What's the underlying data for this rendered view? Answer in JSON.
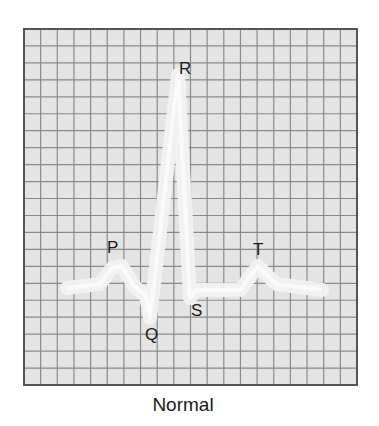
{
  "figure": {
    "caption": "Normal",
    "grid": {
      "left": 24,
      "top": 29,
      "right": 357,
      "bottom": 385,
      "columns": 20,
      "rows": 21,
      "background": "#e4e4e4",
      "line_color": "#8a8a8a",
      "border_color": "#555555"
    },
    "trace_color": "#f2f2f2",
    "labels": [
      {
        "text": "R",
        "x": 179,
        "y": 60
      },
      {
        "text": "P",
        "x": 107,
        "y": 239
      },
      {
        "text": "T",
        "x": 253,
        "y": 241
      },
      {
        "text": "S",
        "x": 191,
        "y": 302
      },
      {
        "text": "Q",
        "x": 145,
        "y": 326
      }
    ]
  },
  "chart_data": {
    "type": "line",
    "title": "Normal",
    "grid": true,
    "waves": [
      "P",
      "Q",
      "R",
      "S",
      "T"
    ],
    "points": [
      {
        "x": 67,
        "y": 288
      },
      {
        "x": 100,
        "y": 284
      },
      {
        "x": 112,
        "y": 268
      },
      {
        "x": 122,
        "y": 266
      },
      {
        "x": 134,
        "y": 286
      },
      {
        "x": 146,
        "y": 296
      },
      {
        "x": 150,
        "y": 318
      },
      {
        "x": 178,
        "y": 75
      },
      {
        "x": 190,
        "y": 298
      },
      {
        "x": 196,
        "y": 290
      },
      {
        "x": 240,
        "y": 290
      },
      {
        "x": 258,
        "y": 266
      },
      {
        "x": 276,
        "y": 284
      },
      {
        "x": 322,
        "y": 290
      }
    ]
  }
}
